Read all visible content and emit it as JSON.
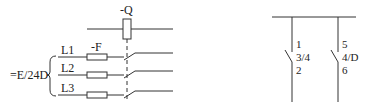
{
  "left_diagram": {
    "breaker_label": "-Q",
    "fuse_label": "-F",
    "phases": [
      "L1",
      "L2",
      "L3"
    ],
    "reference_label": "=E/24D"
  },
  "right_diagram": {
    "contacts": [
      {
        "top": "1",
        "ref": "3/4",
        "bottom": "2"
      },
      {
        "top": "5",
        "ref": "4/D",
        "bottom": "6"
      }
    ]
  },
  "colors": {
    "line": "#333333",
    "background": "#ffffff"
  }
}
